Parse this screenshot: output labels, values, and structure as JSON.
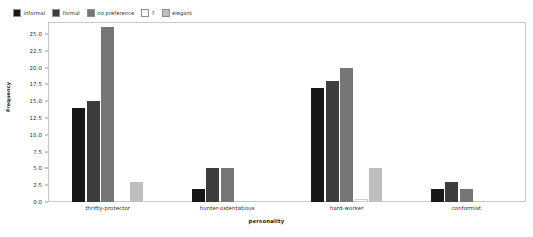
{
  "chart_data": {
    "type": "bar",
    "title": "",
    "xlabel": "personality",
    "ylabel": "Frequency",
    "categories": [
      "thrifty-protector",
      "hunter-ostentatious",
      "hard-worker",
      "conformist"
    ],
    "series": [
      {
        "name": "informal",
        "color": "#171717",
        "values": [
          14,
          2,
          17,
          2
        ]
      },
      {
        "name": "formal",
        "color": "#3d3d3d",
        "values": [
          15,
          5,
          18,
          3
        ]
      },
      {
        "name": "no preference",
        "color": "#767676",
        "values": [
          26,
          5,
          20,
          2
        ]
      },
      {
        "name": "?",
        "color": "#fbfbfb",
        "values": [
          0,
          0,
          0.5,
          0
        ]
      },
      {
        "name": "elegant",
        "color": "#bfbfbf",
        "values": [
          3,
          0,
          5,
          0
        ]
      }
    ],
    "ylim": [
      0,
      26.8
    ],
    "yticks": [
      "0.0",
      "2.5",
      "5.0",
      "7.5",
      "10.0",
      "12.5",
      "15.0",
      "17.5",
      "20.0",
      "22.5",
      "25.0"
    ],
    "ytick_values": [
      0,
      2.5,
      5,
      7.5,
      10,
      12.5,
      15,
      17.5,
      20,
      22.5,
      25
    ],
    "grid": false,
    "legend_position": "above-left"
  }
}
